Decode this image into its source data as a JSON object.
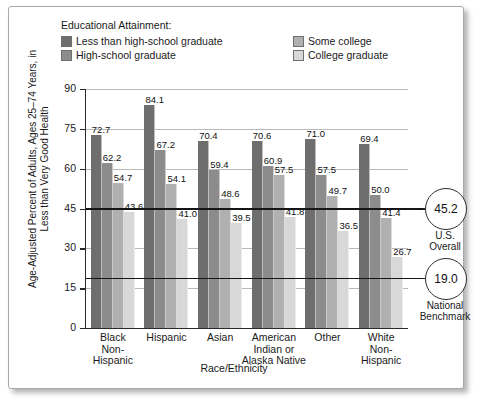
{
  "legend": {
    "title": "Educational Attainment:",
    "items": [
      {
        "label": "Less than high-school graduate",
        "color": "#6e6e6e"
      },
      {
        "label": "High-school graduate",
        "color": "#8c8c8c"
      },
      {
        "label": "Some college",
        "color": "#b0b0b0"
      },
      {
        "label": "College graduate",
        "color": "#d8d8d8"
      }
    ]
  },
  "chart_data": {
    "type": "bar",
    "title": "",
    "xlabel": "Race/Ethnicity",
    "ylabel": "Age-Adjusted Percent of Adults, Ages 25–74 Years, in Less than Very Good Health",
    "ylim": [
      0,
      90
    ],
    "yticks": [
      0,
      15,
      30,
      45,
      60,
      75,
      90
    ],
    "grid": true,
    "legend_position": "top",
    "categories": [
      "Black Non-Hispanic",
      "Hispanic",
      "Asian",
      "American Indian or Alaska Native",
      "Other",
      "White Non-Hispanic"
    ],
    "category_lines": [
      [
        "Black",
        "Non-",
        "Hispanic"
      ],
      [
        "Hispanic"
      ],
      [
        "Asian"
      ],
      [
        "American",
        "Indian or",
        "Alaska Native"
      ],
      [
        "Other"
      ],
      [
        "White",
        "Non-",
        "Hispanic"
      ]
    ],
    "series": [
      {
        "name": "Less than high-school graduate",
        "color": "#6e6e6e",
        "values": [
          72.7,
          84.1,
          70.4,
          70.6,
          71.0,
          69.4
        ]
      },
      {
        "name": "High-school graduate",
        "color": "#8c8c8c",
        "values": [
          62.2,
          67.2,
          59.4,
          60.9,
          57.5,
          50.0
        ]
      },
      {
        "name": "Some college",
        "color": "#b0b0b0",
        "values": [
          54.7,
          54.1,
          48.6,
          57.5,
          49.7,
          41.4
        ]
      },
      {
        "name": "College graduate",
        "color": "#d8d8d8",
        "values": [
          43.6,
          41.0,
          39.5,
          41.8,
          36.5,
          26.7
        ]
      }
    ],
    "reference_lines": [
      {
        "value": 45.2,
        "label": "45.2",
        "caption": "U.S. Overall",
        "caption_lines": [
          "U.S.",
          "Overall"
        ]
      },
      {
        "value": 19.0,
        "label": "19.0",
        "caption": "National Benchmark",
        "caption_lines": [
          "National",
          "Benchmark"
        ]
      }
    ]
  }
}
